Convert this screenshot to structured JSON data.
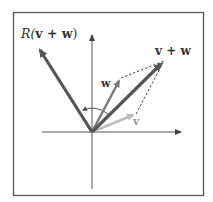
{
  "figure": {
    "labels": {
      "rotated_sum": "R(v + w)",
      "rotated_sum_prefix": "R(",
      "rotated_sum_inner": "v + w",
      "rotated_sum_suffix": ")",
      "sum": "v + w",
      "w": "w",
      "v": "v"
    },
    "colors": {
      "frame": "#555555",
      "axes": "#444444",
      "rotated_sum_vector": "#555555",
      "sum_vector": "#555555",
      "w_vector": "#7a7a7a",
      "v_vector": "#bdbdbd",
      "dashed": "#333333",
      "arc": "#444444"
    },
    "vectors": [
      {
        "name": "R(v + w)",
        "from": [
          92,
          132
        ],
        "to": [
          38,
          46
        ]
      },
      {
        "name": "v + w",
        "from": [
          92,
          132
        ],
        "to": [
          164,
          61
        ]
      },
      {
        "name": "w",
        "from": [
          92,
          132
        ],
        "to": [
          121,
          78
        ]
      },
      {
        "name": "v",
        "from": [
          92,
          132
        ],
        "to": [
          136,
          114
        ]
      }
    ]
  }
}
